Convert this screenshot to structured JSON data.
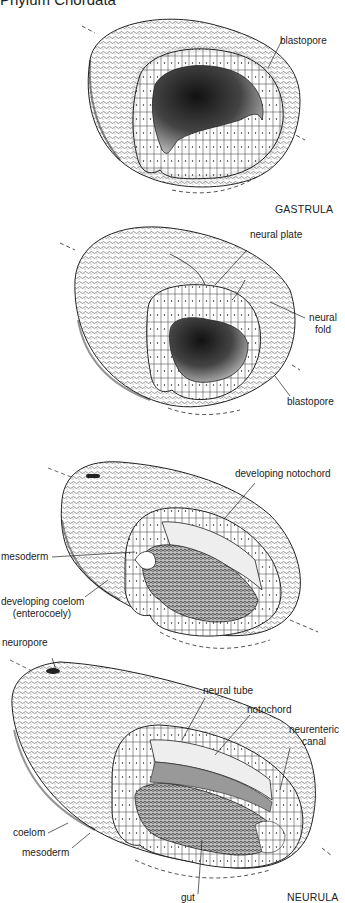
{
  "header": {
    "title": "Phylum Chordata"
  },
  "figures": [
    {
      "stage": "GASTRULA",
      "labels": [
        {
          "text": "blastopore"
        }
      ]
    },
    {
      "stage": "",
      "labels": [
        {
          "text": "neural plate"
        },
        {
          "text": "neural",
          "text2": "fold"
        },
        {
          "text": "blastopore"
        }
      ]
    },
    {
      "stage": "",
      "labels": [
        {
          "text": "developing notochord"
        },
        {
          "text": "mesoderm"
        },
        {
          "text": "developing coelom",
          "text2": "(enterocoely)"
        }
      ]
    },
    {
      "stage": "NEURULA",
      "labels": [
        {
          "text": "neuropore"
        },
        {
          "text": "neural tube"
        },
        {
          "text": "notochord"
        },
        {
          "text": "neurenteric",
          "text2": "canal"
        },
        {
          "text": "coelom"
        },
        {
          "text": "mesoderm"
        },
        {
          "text": "gut"
        }
      ]
    }
  ],
  "colors": {
    "ink": "#1a1a1a",
    "background": "#ffffff",
    "shade": "#555555"
  }
}
